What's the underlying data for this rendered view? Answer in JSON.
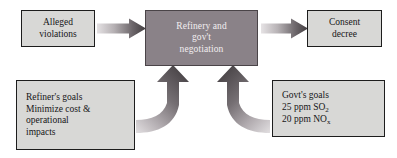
{
  "diagram": {
    "background_color": "#ffffff",
    "box_fill_light": "#d8d8d6",
    "box_fill_dark": "#8a8288",
    "box_border_color": "#1d1d1d",
    "arrow_dark_color": "#4f4a4d",
    "arrow_light_color": "#d6d2d4"
  },
  "nodes": {
    "alleged_violations": {
      "name": "Alleged violations",
      "lines": [
        "Alleged",
        "violations"
      ]
    },
    "negotiation": {
      "name": "Refinery and gov't negotiation",
      "lines": [
        "Refinery and",
        "gov't",
        "negotiation"
      ]
    },
    "consent_decree": {
      "name": "Consent decree",
      "lines": [
        "Consent",
        "decree"
      ]
    },
    "refiner_goals": {
      "name": "Refiner's goals",
      "lines": [
        "Refiner's goals",
        "Minimize cost &",
        "operational",
        "impacts"
      ]
    },
    "govt_goals": {
      "name": "Govt's goals",
      "lines": [
        "Govt's goals",
        "25 ppm SO",
        "20 ppm NO"
      ],
      "line2_base": "25 ppm SO",
      "line2_sub": "2",
      "line3_base": "20 ppm NO",
      "line3_sub": "x",
      "line1": "Govt's goals"
    }
  },
  "arrows": [
    {
      "name": "arrow-violations-to-negotiation",
      "from": "alleged_violations",
      "to": "negotiation",
      "style": "straight-right",
      "gradient": "light-to-dark"
    },
    {
      "name": "arrow-negotiation-to-decree",
      "from": "negotiation",
      "to": "consent_decree",
      "style": "straight-right",
      "gradient": "light-to-dark"
    },
    {
      "name": "arrow-refiner-goals-to-negotiation",
      "from": "refiner_goals",
      "to": "negotiation",
      "style": "curved-up-from-left",
      "gradient": "light-to-dark"
    },
    {
      "name": "arrow-govt-goals-to-negotiation",
      "from": "govt_goals",
      "to": "negotiation",
      "style": "curved-up-from-right",
      "gradient": "light-to-dark"
    }
  ]
}
